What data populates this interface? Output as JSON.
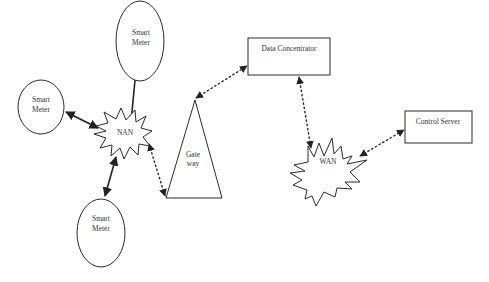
{
  "diagram": {
    "title": "",
    "nodes": {
      "smart_meter_top": {
        "line1": "Smart",
        "line2": "Meter"
      },
      "smart_meter_left": {
        "line1": "Smart",
        "line2": "Meter"
      },
      "smart_meter_bottom": {
        "line1": "Smart",
        "line2": "Meter"
      },
      "nan": {
        "label": "NAN"
      },
      "gateway": {
        "line1": "Gate",
        "line2": "way"
      },
      "data_concentrator": {
        "label": "Data Concentrator"
      },
      "wan": {
        "label": "WAN"
      },
      "control_server": {
        "label": "Control Server"
      }
    },
    "edges": [
      {
        "from": "smart_meter_top",
        "to": "nan",
        "style": "solid",
        "arrows": "none"
      },
      {
        "from": "smart_meter_left",
        "to": "nan",
        "style": "solid",
        "arrows": "both"
      },
      {
        "from": "nan",
        "to": "smart_meter_bottom",
        "style": "solid",
        "arrows": "both"
      },
      {
        "from": "nan",
        "to": "gateway",
        "style": "dashed",
        "arrows": "both"
      },
      {
        "from": "gateway",
        "to": "data_concentrator",
        "style": "dashed",
        "arrows": "both"
      },
      {
        "from": "data_concentrator",
        "to": "wan",
        "style": "dashed",
        "arrows": "both"
      },
      {
        "from": "wan",
        "to": "control_server",
        "style": "dashed",
        "arrows": "both"
      }
    ],
    "colors": {
      "background": "#ffffff",
      "stroke": "#222222",
      "text": "#333333"
    }
  }
}
